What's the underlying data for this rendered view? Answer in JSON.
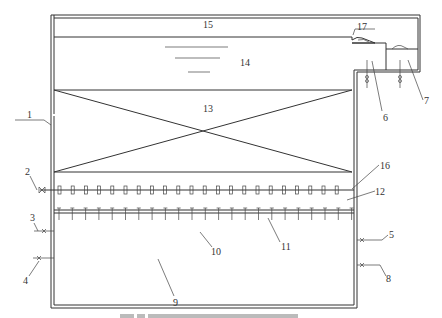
{
  "diagram": {
    "type": "apparatus-schematic",
    "labels": [
      {
        "id": "1",
        "x": 29,
        "y": 118
      },
      {
        "id": "2",
        "x": 27,
        "y": 174
      },
      {
        "id": "3",
        "x": 31,
        "y": 219
      },
      {
        "id": "4",
        "x": 25,
        "y": 283
      },
      {
        "id": "5",
        "x": 389,
        "y": 237
      },
      {
        "id": "6",
        "x": 163,
        "y": 0
      },
      {
        "id": "7",
        "x": 425,
        "y": 104
      },
      {
        "id": "8",
        "x": 387,
        "y": 282
      },
      {
        "id": "9",
        "x": 176,
        "y": 307
      },
      {
        "id": "10",
        "x": 212,
        "y": 253
      },
      {
        "id": "11",
        "x": 282,
        "y": 248
      },
      {
        "id": "12",
        "x": 378,
        "y": 195
      },
      {
        "id": "13",
        "x": 207,
        "y": 111
      },
      {
        "id": "14",
        "x": 244,
        "y": 66
      },
      {
        "id": "15",
        "x": 207,
        "y": 28
      },
      {
        "id": "16",
        "x": 380,
        "y": 167
      },
      {
        "id": "17",
        "x": 357,
        "y": 31
      }
    ],
    "label_text": {
      "l1": "1",
      "l2": "2",
      "l3": "3",
      "l4": "4",
      "l5": "5",
      "l6": "6",
      "l7": "7",
      "l8": "8",
      "l9": "9",
      "l10": "10",
      "l11": "11",
      "l12": "12",
      "l13": "13",
      "l14": "14",
      "l15": "15",
      "l16": "16",
      "l17": "17"
    },
    "colors": {
      "line": "#333333",
      "background": "#ffffff",
      "caption": "#bbbbbb"
    }
  }
}
